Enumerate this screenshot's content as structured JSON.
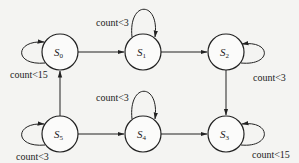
{
  "diagram": {
    "type": "state-machine",
    "states": [
      {
        "id": "S0",
        "base": "S",
        "sub": "0",
        "cx": 60,
        "cy": 52
      },
      {
        "id": "S1",
        "base": "S",
        "sub": "1",
        "cx": 143,
        "cy": 52
      },
      {
        "id": "S2",
        "base": "S",
        "sub": "2",
        "cx": 226,
        "cy": 52
      },
      {
        "id": "S3",
        "base": "S",
        "sub": "3",
        "cx": 226,
        "cy": 134
      },
      {
        "id": "S4",
        "base": "S",
        "sub": "4",
        "cx": 143,
        "cy": 134
      },
      {
        "id": "S5",
        "base": "S",
        "sub": "5",
        "cx": 60,
        "cy": 134
      }
    ],
    "transitions": [
      {
        "from": "S0",
        "to": "S1",
        "label": ""
      },
      {
        "from": "S1",
        "to": "S2",
        "label": ""
      },
      {
        "from": "S2",
        "to": "S3",
        "label": ""
      },
      {
        "from": "S5",
        "to": "S4",
        "label": ""
      },
      {
        "from": "S4",
        "to": "S3",
        "label": ""
      },
      {
        "from": "S5",
        "to": "S0",
        "label": ""
      }
    ],
    "self_loops": [
      {
        "state": "S0",
        "side": "left",
        "label": "count<15"
      },
      {
        "state": "S1",
        "side": "top",
        "label": "count<3"
      },
      {
        "state": "S2",
        "side": "right",
        "label": "count<3"
      },
      {
        "state": "S3",
        "side": "right",
        "label": "count<15"
      },
      {
        "state": "S4",
        "side": "top",
        "label": "count<3"
      },
      {
        "state": "S5",
        "side": "left",
        "label": "count<3"
      }
    ]
  }
}
